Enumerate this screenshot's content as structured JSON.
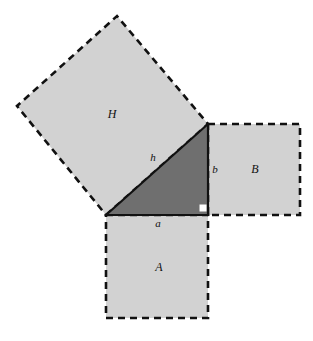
{
  "figure": {
    "canvas": {
      "width": 313,
      "height": 341,
      "background": "#ffffff"
    },
    "colors": {
      "square_fill": "#d2d2d2",
      "triangle_fill": "#6f6f6f",
      "stroke": "#111111",
      "right_angle_marker": "#ffffff"
    },
    "stroke": {
      "dash_pattern": "7,5",
      "dash_width": 2.6,
      "solid_width": 2.2
    }
  },
  "triangle": {
    "name": "right-triangle",
    "fill": "#6f6f6f",
    "vertices": [
      {
        "name": "left-vertex",
        "x": 106,
        "y": 215
      },
      {
        "name": "apex-vertex",
        "x": 208,
        "y": 124
      },
      {
        "name": "right-angle-vertex",
        "x": 208,
        "y": 215
      }
    ],
    "points_attr": "106,215 208,124 208,215",
    "right_angle": {
      "label": "right-angle-marker",
      "x": 200,
      "y": 205,
      "size": 7,
      "fill": "#ffffff"
    }
  },
  "squares": [
    {
      "id": "H",
      "label": "H",
      "description": "square on the hypotenuse",
      "fill": "#d2d2d2",
      "points_attr": "106,215 208,124 117,16 17,106",
      "label_x": 112,
      "label_y": 115
    },
    {
      "id": "B",
      "label": "B",
      "description": "square on leg b",
      "fill": "#d2d2d2",
      "points_attr": "208,124 300,124 300,215 208,215",
      "label_x": 255,
      "label_y": 170
    },
    {
      "id": "A",
      "label": "A",
      "description": "square on leg a",
      "fill": "#d2d2d2",
      "points_attr": "106,215 208,215 208,318 106,318",
      "label_x": 159,
      "label_y": 268
    }
  ],
  "side_labels": [
    {
      "id": "h",
      "label": "h",
      "description": "hypotenuse length",
      "x": 153,
      "y": 158
    },
    {
      "id": "b",
      "label": "b",
      "description": "vertical leg length",
      "x": 215,
      "y": 170
    },
    {
      "id": "a",
      "label": "a",
      "description": "horizontal leg length",
      "x": 158,
      "y": 224
    }
  ],
  "triangle_edges": [
    {
      "id": "hypotenuse",
      "x1": 106,
      "y1": 215,
      "x2": 208,
      "y2": 124
    },
    {
      "id": "leg-b",
      "x1": 208,
      "y1": 124,
      "x2": 208,
      "y2": 215
    },
    {
      "id": "leg-a",
      "x1": 208,
      "y1": 215,
      "x2": 106,
      "y2": 215
    }
  ]
}
